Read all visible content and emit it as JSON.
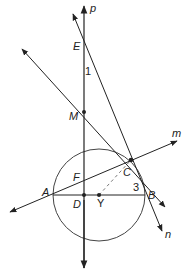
{
  "figure": {
    "type": "geometry-diagram",
    "colors": {
      "stroke": "#222222",
      "circle": "#444444",
      "dashed": "#777777",
      "background": "#ffffff"
    },
    "lines": [
      {
        "name": "p",
        "label": "p"
      },
      {
        "name": "m",
        "label": "m"
      },
      {
        "name": "n",
        "label": "n"
      },
      {
        "name": "MC",
        "label": ""
      }
    ],
    "points": {
      "E": "E",
      "M": "M",
      "F": "F",
      "A": "A",
      "D": "D",
      "C": "C",
      "B": "B",
      "Y": "Y"
    },
    "angles": {
      "angle1": "1",
      "angle3": "3"
    },
    "circle": {
      "center_label": "Y"
    }
  }
}
